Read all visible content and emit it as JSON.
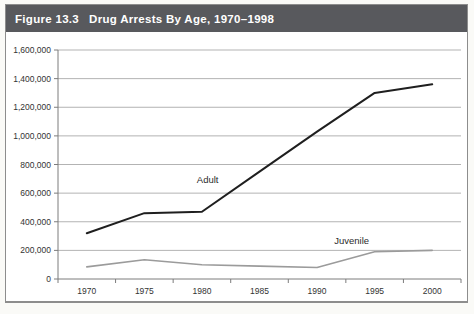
{
  "figure": {
    "header": {
      "label": "Figure 13.3",
      "title": "Drug Arrests By Age, 1970–1998"
    },
    "colors": {
      "page_bg": "#fafaf7",
      "header_bg": "#58595d",
      "header_text": "#ffffff",
      "chart_bg": "#ffffff",
      "panel_border": "#8d8d8d",
      "gridline": "#b3b3b3",
      "axis": "#7c7c7c",
      "tick_text": "#333333",
      "adult_line": "#1f1f1f",
      "juvenile_line": "#9b9b9b"
    }
  },
  "chart_data": {
    "type": "line",
    "title": "Drug Arrests By Age, 1970–1998",
    "categories": [
      "1970",
      "1975",
      "1980",
      "1985",
      "1990",
      "1995",
      "2000"
    ],
    "series": [
      {
        "name": "Adult",
        "values": [
          320000,
          460000,
          470000,
          750000,
          1030000,
          1300000,
          1360000
        ],
        "color_key": "adult_line",
        "stroke_width": 2
      },
      {
        "name": "Juvenile",
        "values": [
          85000,
          135000,
          100000,
          90000,
          80000,
          190000,
          200000
        ],
        "color_key": "juvenile_line",
        "stroke_width": 1.6
      }
    ],
    "ylim": [
      0,
      1600000
    ],
    "ytick_step": 200000,
    "ytick_labels": [
      "0",
      "200,000",
      "400,000",
      "600,000",
      "800,000",
      "1,000,000",
      "1,200,000",
      "1,400,000",
      "1,600,000"
    ],
    "grid": true,
    "legend": "inline-labels",
    "annotations": [
      {
        "text": "Adult",
        "year": 1980.5,
        "value": 690000
      },
      {
        "text": "Juvenile",
        "year": 1993,
        "value": 268000
      }
    ]
  }
}
